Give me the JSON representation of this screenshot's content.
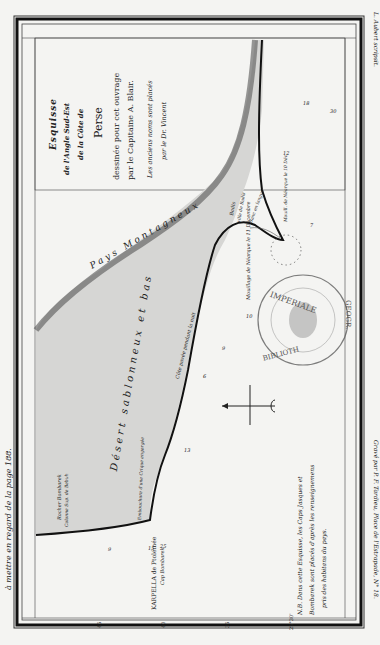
{
  "margin": {
    "left_note": "à mettre en regard de la page 188.",
    "right_top": "L. Aubert scripsit.",
    "right_bottom": "Gravé par P. F. Tardieu, Place de l'Estrapade, N° 18."
  },
  "title": {
    "line1": "Esquisse",
    "line2": "de l'Angle Sud-Est",
    "line3": "de la Côte de",
    "line4": "Perse",
    "line5": "dessinée pour cet ouvrage",
    "line6": "par le Capitaine A. Blair.",
    "line7": "Les anciens noms sont placés",
    "line8": "par le Dr. Vincent"
  },
  "labels": {
    "mountains": "Pays Montagneux",
    "desert": "Désert sablonneux et bas",
    "coast_note": "Côte pavée pendant la nuit",
    "badis": "Badis",
    "badis_sub": "ville de Badis",
    "tongue": "Banc en langue",
    "anchor_dec11": "Mouillage de Néarque le 11 Décembre",
    "anchor_dec10": "Mouill. de Néarque le 10 Déc.",
    "rocher": "Rocher Bombarek",
    "colonne": "Colonne Sup. de Bebuh",
    "embouchure": "Embouchure d'une Crique engorgée",
    "karpella": "KARPELLA de Ptolémée",
    "cap": "Cap Bombarek",
    "nb_line1": "N.B. Dans cette Esquisse, les Caps Jasques et",
    "nb_line2": "Bombarek sont placés d'après les renseignemens",
    "nb_line3": "pris des habitans du pays."
  },
  "stamp": {
    "top": "IMPERIALE",
    "right": "GEOGR.",
    "bottom": "BIBLIOTH"
  },
  "soundings": [
    "30",
    "18",
    "12",
    "10",
    "7",
    "10",
    "9",
    "6",
    "13",
    "15",
    "12",
    "9",
    "25"
  ],
  "latitudes": [
    "45",
    "40",
    "35",
    "25°30'"
  ],
  "compass": "compass-rose"
}
